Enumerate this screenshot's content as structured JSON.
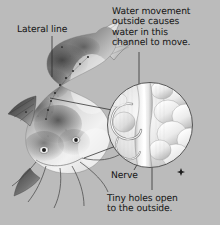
{
  "figure": {
    "background_color": "#bbbbbb",
    "text_color": "#141414",
    "width": 220,
    "height": 225
  },
  "labels": {
    "lateral_line": "Lateral line",
    "water_movement": "Water movement\noutside causes\nwater in this\nchannel to move.",
    "nerve": "Nerve",
    "tiny_holes": "Tiny holes open\nto the outside."
  },
  "illustration": {
    "subject": "catfish",
    "description": "Grayscale stippled drawing of a catfish seen from above-front, showing forked tail at upper right, mottled dark dorsal shading, pale belly, pectoral fin at left, broad flat head at lower left with eyes and several long barbels trailing down and to the right.",
    "lateral_line_dots": "row of small dark pores along the flank"
  },
  "inset": {
    "shape": "circle",
    "description": "Magnified cutaway of the lateral line canal: a bright vertical channel runs down the middle, a curved neuromast and nerve loop sits at the left, and rounded scale-like lobes fill the right side.",
    "center_x": 150,
    "center_y": 125,
    "radius": 43,
    "border_color": "#4a4a4a"
  },
  "markers": {
    "star": {
      "name": "star-marker",
      "x": 181,
      "y": 172
    }
  },
  "leaders": {
    "lateral_line_to_fish": "vertical line from Lateral line label down to the flank pores",
    "water_movement_to_inset": "vertical line from Water movement text down to the canal in the inset",
    "fish_flank_to_inset": "diagonal line from the fish flank to the left edge of the inset",
    "fish_head_to_inset": "diagonal line from the fish head to the lower left of the inset",
    "nerve_to_inset": "short diagonal line from Nerve label up into the inset",
    "tiny_holes_to_inset": "vertical line from Tiny holes text up to the channel openings"
  }
}
